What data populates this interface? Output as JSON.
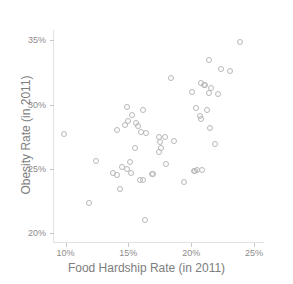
{
  "chart_data": {
    "type": "scatter",
    "title": "",
    "xlabel": "Food Hardship Rate (in 2011)",
    "ylabel": "Obesity Rate (in 2011)",
    "xlim": [
      9.0,
      25.8
    ],
    "ylim": [
      19.3,
      35.8
    ],
    "xtick_labels": [
      "10%",
      "15%",
      "20%",
      "25%"
    ],
    "xtick_values": [
      10,
      15,
      20,
      25
    ],
    "ytick_labels": [
      "20%",
      "25%",
      "30%",
      "35%"
    ],
    "ytick_values": [
      20,
      25,
      30,
      35
    ],
    "grid": false,
    "legend": null,
    "marker": "open-circle",
    "marker_color": "#b8b8b8",
    "marker_size": 6,
    "series": [
      {
        "name": "States",
        "points": [
          [
            23.9,
            34.9
          ],
          [
            21.4,
            33.5
          ],
          [
            22.4,
            32.8
          ],
          [
            23.1,
            32.6
          ],
          [
            18.4,
            32.1
          ],
          [
            20.8,
            31.7
          ],
          [
            21.0,
            31.5
          ],
          [
            21.1,
            31.5
          ],
          [
            21.6,
            31.3
          ],
          [
            20.1,
            31.0
          ],
          [
            21.4,
            30.9
          ],
          [
            22.1,
            30.8
          ],
          [
            14.9,
            29.8
          ],
          [
            16.2,
            29.6
          ],
          [
            20.4,
            29.7
          ],
          [
            21.3,
            29.6
          ],
          [
            15.3,
            29.2
          ],
          [
            20.7,
            29.1
          ],
          [
            20.8,
            28.9
          ],
          [
            15.0,
            28.7
          ],
          [
            15.6,
            28.6
          ],
          [
            14.7,
            28.4
          ],
          [
            15.8,
            28.3
          ],
          [
            21.5,
            28.2
          ],
          [
            14.1,
            28.0
          ],
          [
            16.0,
            27.9
          ],
          [
            16.4,
            27.8
          ],
          [
            9.9,
            27.7
          ],
          [
            17.4,
            27.5
          ],
          [
            17.9,
            27.5
          ],
          [
            17.5,
            27.1
          ],
          [
            18.6,
            27.2
          ],
          [
            21.9,
            26.9
          ],
          [
            15.5,
            26.6
          ],
          [
            17.6,
            26.6
          ],
          [
            17.4,
            26.3
          ],
          [
            12.4,
            25.6
          ],
          [
            15.1,
            25.5
          ],
          [
            18.0,
            25.4
          ],
          [
            14.5,
            25.1
          ],
          [
            14.9,
            25.0
          ],
          [
            20.5,
            24.9
          ],
          [
            20.9,
            24.9
          ],
          [
            13.8,
            24.7
          ],
          [
            15.2,
            24.7
          ],
          [
            16.9,
            24.6
          ],
          [
            17.0,
            24.6
          ],
          [
            20.2,
            24.8
          ],
          [
            20.3,
            24.8
          ],
          [
            14.1,
            24.5
          ],
          [
            15.9,
            24.1
          ],
          [
            16.2,
            24.1
          ],
          [
            19.4,
            24.0
          ],
          [
            14.3,
            23.4
          ],
          [
            11.9,
            22.3
          ],
          [
            16.3,
            21.0
          ]
        ]
      }
    ]
  }
}
